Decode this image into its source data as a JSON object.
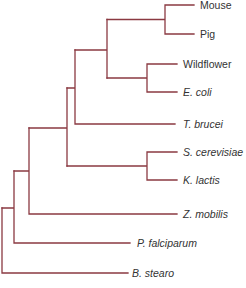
{
  "diagram": {
    "type": "phylogenetic-tree",
    "line_color": "#8b3a42",
    "label_color": "#333333",
    "taxa": [
      {
        "name": "Mouse",
        "italic": false,
        "y": 5,
        "x_end": 194
      },
      {
        "name": "Pig",
        "italic": false,
        "y": 34,
        "x_end": 194
      },
      {
        "name": "Wildflower",
        "italic": false,
        "y": 64,
        "x_end": 177
      },
      {
        "name": "E. coli",
        "italic": true,
        "y": 92,
        "x_end": 177
      },
      {
        "name": "T. brucei",
        "italic": true,
        "y": 124,
        "x_end": 175
      },
      {
        "name": "S. cerevisiae",
        "italic": true,
        "y": 152,
        "x_end": 177
      },
      {
        "name": "K. lactis",
        "italic": true,
        "y": 180,
        "x_end": 177
      },
      {
        "name": "Z. mobilis",
        "italic": true,
        "y": 214,
        "x_end": 177
      },
      {
        "name": "P. falciparum",
        "italic": true,
        "y": 243,
        "x_end": 130
      },
      {
        "name": "B. stearo",
        "italic": true,
        "y": 273,
        "x_end": 128
      }
    ],
    "topology": "(((((Mouse,Pig),(Wildflower,E. coli)),T. brucei),(S. cerevisiae,K. lactis)),Z. mobilis),P. falciparum),B. stearo)"
  }
}
